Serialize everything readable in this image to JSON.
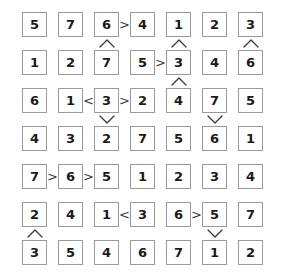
{
  "puzzle": {
    "type": "futoshiki-grid",
    "rows": 7,
    "cols": 7,
    "colors": {
      "cell_border": "#9a9a9a",
      "cell_background": "#ffffff",
      "digit": "#1a1a1a",
      "sign": "#3a3a3a",
      "page_background": "#ffffff"
    },
    "grid": [
      [
        "5",
        "7",
        "6",
        "4",
        "1",
        "2",
        "3"
      ],
      [
        "1",
        "2",
        "7",
        "5",
        "3",
        "4",
        "6"
      ],
      [
        "6",
        "1",
        "3",
        "2",
        "4",
        "7",
        "5"
      ],
      [
        "4",
        "3",
        "2",
        "7",
        "5",
        "6",
        "1"
      ],
      [
        "7",
        "6",
        "5",
        "1",
        "2",
        "3",
        "4"
      ],
      [
        "2",
        "4",
        "1",
        "3",
        "6",
        "5",
        "7"
      ],
      [
        "3",
        "5",
        "4",
        "6",
        "7",
        "1",
        "2"
      ]
    ],
    "horizontal_signs": [
      {
        "row": 0,
        "col": 2,
        "label": ">"
      },
      {
        "row": 1,
        "col": 3,
        "label": ">"
      },
      {
        "row": 2,
        "col": 1,
        "label": "<"
      },
      {
        "row": 2,
        "col": 2,
        "label": ">"
      },
      {
        "row": 4,
        "col": 0,
        "label": ">"
      },
      {
        "row": 4,
        "col": 1,
        "label": ">"
      },
      {
        "row": 5,
        "col": 2,
        "label": "<"
      },
      {
        "row": 5,
        "col": 4,
        "label": ">"
      }
    ],
    "vertical_signs": [
      {
        "row": 0,
        "col": 2,
        "label": "^"
      },
      {
        "row": 0,
        "col": 4,
        "label": "^"
      },
      {
        "row": 0,
        "col": 6,
        "label": "^"
      },
      {
        "row": 1,
        "col": 4,
        "label": "^"
      },
      {
        "row": 2,
        "col": 2,
        "label": "v"
      },
      {
        "row": 2,
        "col": 5,
        "label": "v"
      },
      {
        "row": 5,
        "col": 0,
        "label": "^"
      },
      {
        "row": 5,
        "col": 5,
        "label": "v"
      }
    ]
  }
}
